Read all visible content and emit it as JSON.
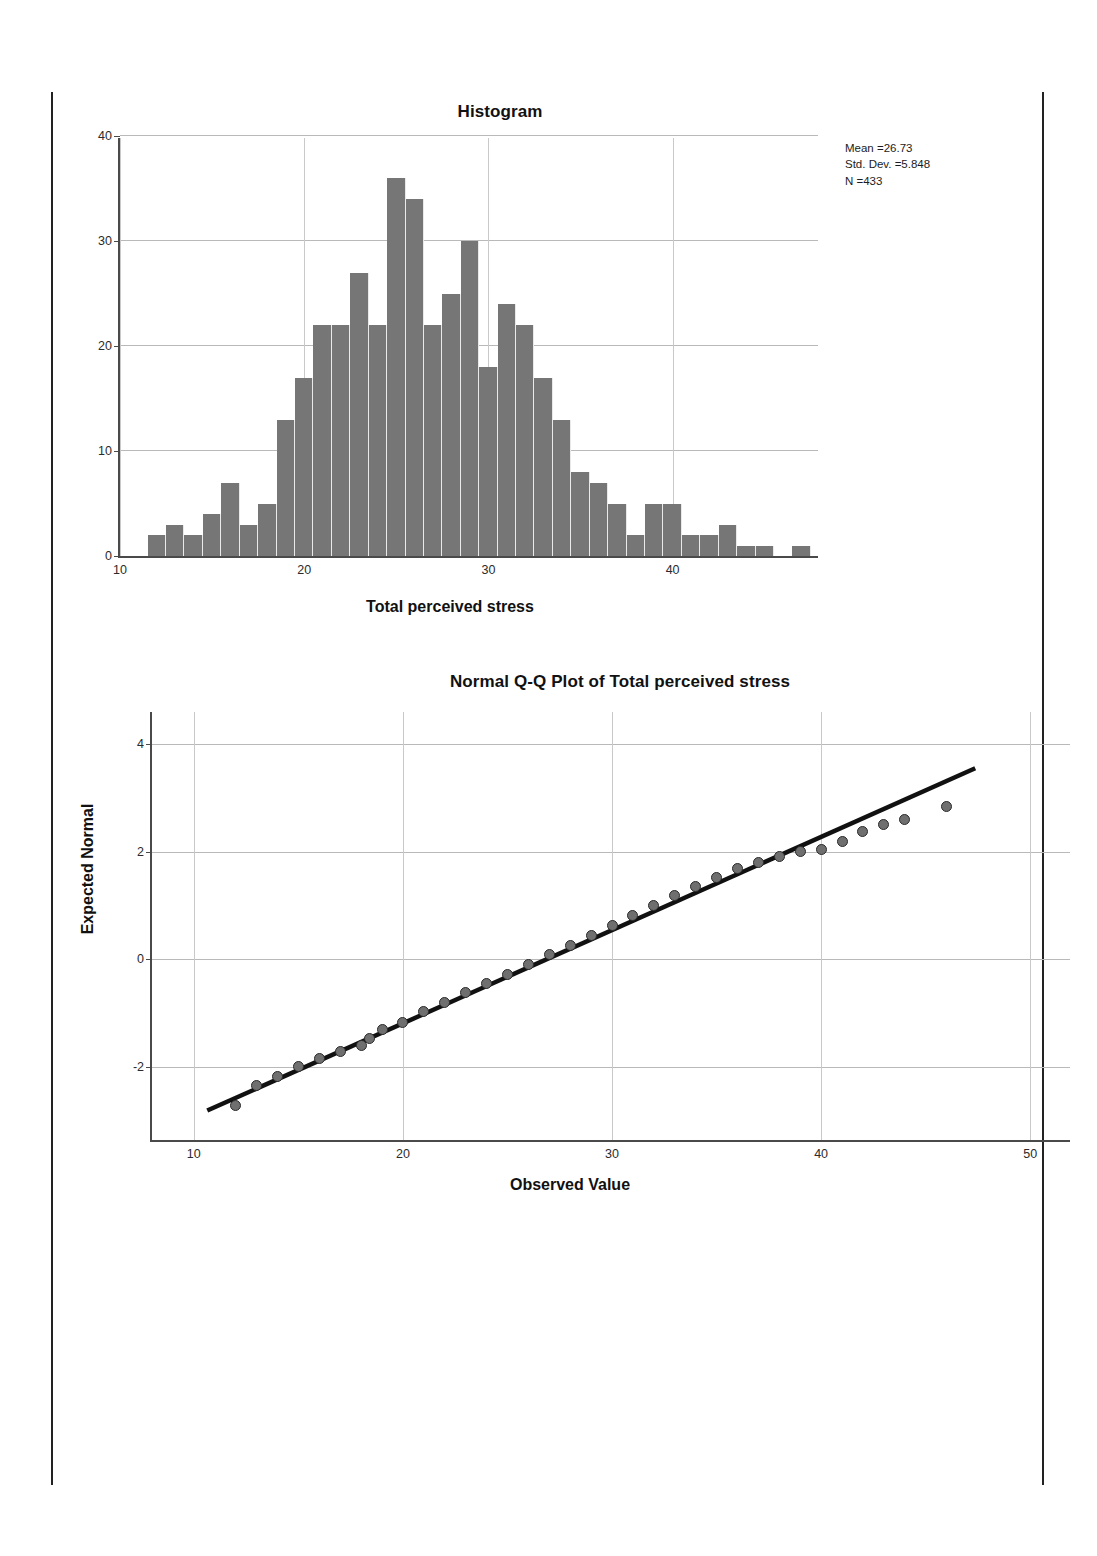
{
  "page": {
    "background_color": "#ffffff",
    "rule_color": "#222222"
  },
  "histogram": {
    "title": "Histogram",
    "xlabel": "Total perceived stress",
    "stats": {
      "mean_line": "Mean =26.73",
      "stddev_line": "Std. Dev. =5.848",
      "n_line": "N =433"
    }
  },
  "qqplot": {
    "title": "Normal Q-Q Plot of Total perceived stress",
    "xlabel": "Observed Value",
    "ylabel": "Expected Normal"
  },
  "chart_data": [
    {
      "type": "bar",
      "title": "Histogram",
      "xlabel": "Total perceived stress",
      "ylabel": "",
      "xlim": [
        10,
        48
      ],
      "ylim": [
        0,
        40
      ],
      "yticks": [
        0,
        10,
        20,
        30,
        40
      ],
      "xticks": [
        10,
        20,
        30,
        40
      ],
      "grid": true,
      "bar_color": "#767676",
      "bin_width": 1,
      "bin_starts": [
        11.5,
        12.5,
        13.5,
        14.5,
        15.5,
        16.5,
        17.5,
        18.5,
        19.5,
        20.5,
        21.5,
        22.5,
        23.5,
        24.5,
        25.5,
        26.5,
        27.5,
        28.5,
        29.5,
        30.5,
        31.5,
        32.5,
        33.5,
        34.5,
        35.5,
        36.5,
        37.5,
        38.5,
        39.5,
        40.5,
        41.5,
        42.5,
        43.5,
        44.5,
        45.5,
        46.5
      ],
      "categories": [
        "11.5",
        "12.5",
        "13.5",
        "14.5",
        "15.5",
        "16.5",
        "17.5",
        "18.5",
        "19.5",
        "20.5",
        "21.5",
        "22.5",
        "23.5",
        "24.5",
        "25.5",
        "26.5",
        "27.5",
        "28.5",
        "29.5",
        "30.5",
        "31.5",
        "32.5",
        "33.5",
        "34.5",
        "35.5",
        "36.5",
        "37.5",
        "38.5",
        "39.5",
        "40.5",
        "41.5",
        "42.5",
        "43.5",
        "44.5",
        "45.5",
        "46.5"
      ],
      "values": [
        2,
        3,
        2,
        4,
        7,
        3,
        5,
        13,
        17,
        22,
        22,
        27,
        22,
        36,
        34,
        22,
        25,
        30,
        18,
        24,
        22,
        17,
        13,
        8,
        7,
        5,
        2,
        5,
        5,
        2,
        2,
        3,
        1,
        1,
        0,
        1
      ],
      "annotation": [
        "Mean =26.73",
        "Std. Dev. =5.848",
        "N =433"
      ]
    },
    {
      "type": "scatter",
      "title": "Normal Q-Q Plot of Total perceived stress",
      "xlabel": "Observed Value",
      "ylabel": "Expected Normal",
      "xlim": [
        8,
        52
      ],
      "ylim": [
        -3.4,
        4.6
      ],
      "xticks": [
        10,
        20,
        30,
        40,
        50
      ],
      "yticks": [
        -2,
        0,
        2,
        4
      ],
      "grid": true,
      "point_color": "#6f6f6f",
      "point_edge_color": "#2a2a2a",
      "reference_line": {
        "x": [
          10.6,
          47.5
        ],
        "y": [
          -2.85,
          3.55
        ],
        "color": "#111111"
      },
      "x": [
        12,
        13,
        14,
        15,
        16,
        17,
        18,
        18.4,
        19,
        20,
        21,
        22,
        23,
        24,
        25,
        26,
        27,
        28,
        29,
        30,
        31,
        32,
        33,
        34,
        35,
        36,
        37,
        38,
        39,
        40,
        41,
        42,
        43,
        44,
        46
      ],
      "y": [
        -2.72,
        -2.35,
        -2.18,
        -2.0,
        -1.85,
        -1.72,
        -1.6,
        -1.48,
        -1.3,
        -1.18,
        -0.98,
        -0.8,
        -0.62,
        -0.45,
        -0.28,
        -0.1,
        0.08,
        0.26,
        0.44,
        0.62,
        0.82,
        1.0,
        1.18,
        1.36,
        1.52,
        1.68,
        1.8,
        1.92,
        2.0,
        2.05,
        2.2,
        2.38,
        2.5,
        2.6,
        2.85
      ]
    }
  ]
}
